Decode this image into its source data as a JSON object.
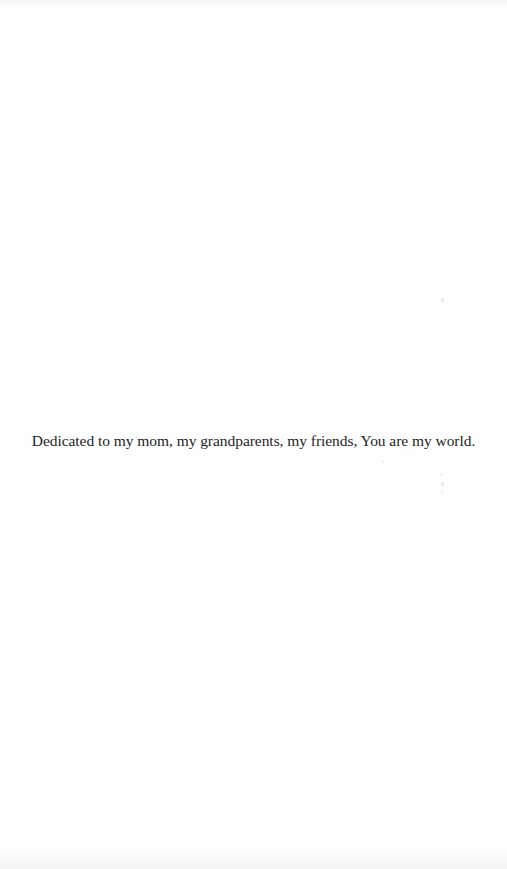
{
  "page": {
    "type": "dedication-page",
    "dedication_text": "Dedicated to my mom, my grandparents, my friends, You are my world."
  }
}
